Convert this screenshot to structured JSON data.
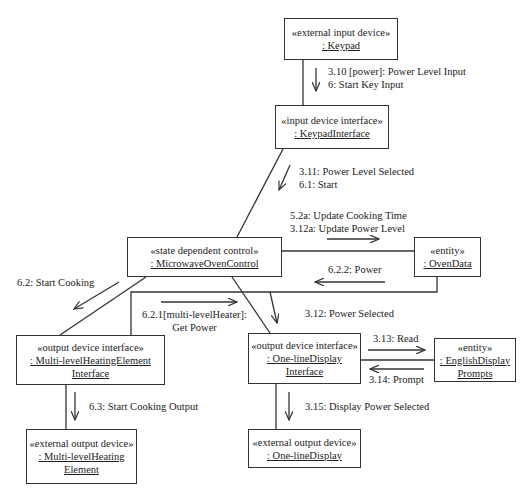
{
  "objects": {
    "keypad": {
      "stereotype": "«external input device»",
      "name_lines": [
        ": Keypad"
      ]
    },
    "keypad_interface": {
      "stereotype": "«input device interface»",
      "name_lines": [
        ": KeypadInterface"
      ]
    },
    "microwave_oven_control": {
      "stereotype": "«state dependent control»",
      "name_lines": [
        ": MicrowaveOvenControl"
      ]
    },
    "oven_data": {
      "stereotype": "«entity»",
      "name_lines": [
        ": OvenData"
      ]
    },
    "multilevel_heating_interface": {
      "stereotype": "«output device interface»",
      "name_lines": [
        ": Multi-levelHeatingElement",
        "Interface"
      ]
    },
    "oneline_display_interface": {
      "stereotype": "«output device interface»",
      "name_lines": [
        ": One-lineDisplay",
        "Interface"
      ]
    },
    "english_display_prompts": {
      "stereotype": "«entity»",
      "name_lines": [
        ": EnglishDisplay",
        "Prompts"
      ]
    },
    "multilevel_heating_element": {
      "stereotype": "«external output device»",
      "name_lines": [
        ": Multi-levelHeating",
        "Element"
      ]
    },
    "oneline_display": {
      "stereotype": "«external output device»",
      "name_lines": [
        ": One-lineDisplay"
      ]
    }
  },
  "messages": {
    "keypad_to_interface": [
      "3.10 [power]: Power Level Input",
      "6: Start Key Input"
    ],
    "interface_to_control": [
      "3.11: Power Level Selected",
      "6.1: Start"
    ],
    "control_to_ovendata": [
      "5.2a: Update Cooking Time",
      "3.12a: Update Power Level"
    ],
    "ovendata_to_control": [
      "6.2.2: Power"
    ],
    "control_to_heating_interface": [
      "6.2: Start Cooking"
    ],
    "heating_interface_to_ovendata": [
      "6.2.1[multi-levelHeater]:",
      "Get Power"
    ],
    "control_to_display_interface": [
      "3.12: Power Selected"
    ],
    "display_interface_to_prompts": [
      "3.13: Read"
    ],
    "prompts_to_display_interface": [
      "3.14: Prompt"
    ],
    "heating_interface_to_element": [
      "6.3: Start Cooking Output"
    ],
    "display_interface_to_display": [
      "3.15: Display Power Selected"
    ]
  },
  "style": {
    "line_color": "#333333",
    "text_color": "#222222",
    "background": "#ffffff"
  }
}
